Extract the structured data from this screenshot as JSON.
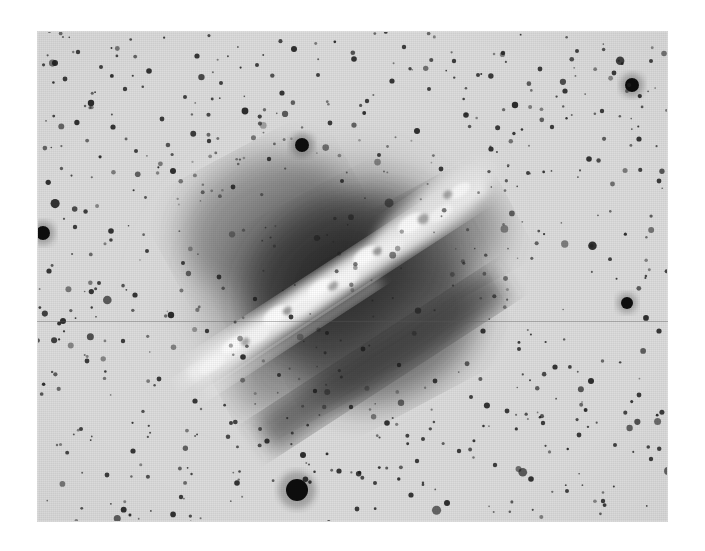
{
  "figure": {
    "kind": "astronomical-photographic-plate",
    "polarity": "negative",
    "caption": ""
  },
  "plate": {
    "left": 37,
    "top": 31,
    "width": 631,
    "height": 491,
    "sky_background_color": "#dcdcdc",
    "page_background_color": "#ffffff",
    "grain_opacity": 0.3
  },
  "galaxy": {
    "center_x": 325,
    "center_y": 268,
    "semi_major": 178,
    "semi_minor": 132,
    "position_angle_deg": -28,
    "halo_color_outer": "#c9c9c9",
    "halo_color_mid": "#8f8f8f",
    "halo_color_core": "#3a3a3a",
    "core_color_darkest": "#262626"
  },
  "dust_lane": {
    "description": "bright band in negative running lower-left to upper-right",
    "start_x": 175,
    "start_y": 395,
    "end_x": 470,
    "end_y": 200,
    "angle_deg": -33,
    "thickness": 34,
    "color_bright": "#f2f2f2",
    "color_mid": "#d0d0d0"
  },
  "artifacts": {
    "scratch_lines": [
      {
        "y": 290,
        "opacity": 0.38
      }
    ]
  },
  "stars": {
    "count_label": "dense foreground star field",
    "color": "#1c1c1c",
    "bright_star_color": "#0d0d0d",
    "notable": [
      {
        "name": "bright-star-bottom-center",
        "x": 260,
        "y": 459,
        "r": 11
      },
      {
        "name": "bright-star-left-edge",
        "x": 6,
        "y": 202,
        "r": 7
      },
      {
        "name": "bright-star-upper-right",
        "x": 595,
        "y": 54,
        "r": 7
      },
      {
        "name": "bright-star-right-mid",
        "x": 590,
        "y": 272,
        "r": 6
      },
      {
        "name": "bright-star-upper-mid",
        "x": 265,
        "y": 114,
        "r": 7
      }
    ]
  },
  "chart_data": {
    "type": "scatter",
    "title": "",
    "xlabel": "",
    "ylabel": "",
    "note": "Star positions on the plate (plate-local pixel coordinates, origin top-left of the plate). r = apparent radius in pixels; larger r = brighter star on the negative.",
    "points": [
      {
        "x": 6,
        "y": 202,
        "r": 7
      },
      {
        "x": 18,
        "y": 32,
        "r": 3
      },
      {
        "x": 28,
        "y": 48,
        "r": 2.4
      },
      {
        "x": 41,
        "y": 21,
        "r": 2.2
      },
      {
        "x": 54,
        "y": 72,
        "r": 3.2
      },
      {
        "x": 64,
        "y": 36,
        "r": 2
      },
      {
        "x": 76,
        "y": 96,
        "r": 2.6
      },
      {
        "x": 88,
        "y": 58,
        "r": 2.2
      },
      {
        "x": 99,
        "y": 120,
        "r": 2
      },
      {
        "x": 112,
        "y": 40,
        "r": 2.8
      },
      {
        "x": 125,
        "y": 88,
        "r": 2.4
      },
      {
        "x": 136,
        "y": 140,
        "r": 3
      },
      {
        "x": 148,
        "y": 66,
        "r": 2
      },
      {
        "x": 160,
        "y": 25,
        "r": 2.6
      },
      {
        "x": 172,
        "y": 110,
        "r": 2.2
      },
      {
        "x": 184,
        "y": 52,
        "r": 2
      },
      {
        "x": 196,
        "y": 156,
        "r": 2.4
      },
      {
        "x": 208,
        "y": 80,
        "r": 3.4
      },
      {
        "x": 220,
        "y": 34,
        "r": 2
      },
      {
        "x": 232,
        "y": 128,
        "r": 2.2
      },
      {
        "x": 245,
        "y": 62,
        "r": 2.6
      },
      {
        "x": 257,
        "y": 18,
        "r": 3
      },
      {
        "x": 265,
        "y": 114,
        "r": 7
      },
      {
        "x": 281,
        "y": 44,
        "r": 2
      },
      {
        "x": 293,
        "y": 92,
        "r": 2.4
      },
      {
        "x": 305,
        "y": 150,
        "r": 2
      },
      {
        "x": 317,
        "y": 28,
        "r": 2.8
      },
      {
        "x": 330,
        "y": 70,
        "r": 2.2
      },
      {
        "x": 342,
        "y": 124,
        "r": 2
      },
      {
        "x": 355,
        "y": 50,
        "r": 2.6
      },
      {
        "x": 367,
        "y": 16,
        "r": 2.2
      },
      {
        "x": 380,
        "y": 100,
        "r": 3
      },
      {
        "x": 392,
        "y": 58,
        "r": 2
      },
      {
        "x": 404,
        "y": 138,
        "r": 2.4
      },
      {
        "x": 417,
        "y": 30,
        "r": 2.2
      },
      {
        "x": 429,
        "y": 84,
        "r": 2.8
      },
      {
        "x": 441,
        "y": 44,
        "r": 2
      },
      {
        "x": 454,
        "y": 118,
        "r": 2.6
      },
      {
        "x": 466,
        "y": 22,
        "r": 2.2
      },
      {
        "x": 478,
        "y": 74,
        "r": 3.2
      },
      {
        "x": 491,
        "y": 142,
        "r": 2
      },
      {
        "x": 503,
        "y": 38,
        "r": 2.4
      },
      {
        "x": 515,
        "y": 96,
        "r": 2.2
      },
      {
        "x": 528,
        "y": 60,
        "r": 2.6
      },
      {
        "x": 540,
        "y": 20,
        "r": 2
      },
      {
        "x": 552,
        "y": 128,
        "r": 2.8
      },
      {
        "x": 565,
        "y": 80,
        "r": 2.2
      },
      {
        "x": 577,
        "y": 42,
        "r": 2.4
      },
      {
        "x": 595,
        "y": 54,
        "r": 7
      },
      {
        "x": 602,
        "y": 108,
        "r": 2.6
      },
      {
        "x": 614,
        "y": 30,
        "r": 2
      },
      {
        "x": 622,
        "y": 150,
        "r": 2.4
      },
      {
        "x": 12,
        "y": 240,
        "r": 2.6
      },
      {
        "x": 26,
        "y": 290,
        "r": 3
      },
      {
        "x": 38,
        "y": 196,
        "r": 2.2
      },
      {
        "x": 50,
        "y": 330,
        "r": 2.4
      },
      {
        "x": 62,
        "y": 252,
        "r": 2
      },
      {
        "x": 74,
        "y": 200,
        "r": 2.8
      },
      {
        "x": 86,
        "y": 310,
        "r": 2.2
      },
      {
        "x": 98,
        "y": 264,
        "r": 2.6
      },
      {
        "x": 110,
        "y": 220,
        "r": 2
      },
      {
        "x": 122,
        "y": 348,
        "r": 2.4
      },
      {
        "x": 134,
        "y": 284,
        "r": 3.2
      },
      {
        "x": 146,
        "y": 232,
        "r": 2
      },
      {
        "x": 158,
        "y": 370,
        "r": 2.6
      },
      {
        "x": 170,
        "y": 300,
        "r": 2.2
      },
      {
        "x": 182,
        "y": 246,
        "r": 2.4
      },
      {
        "x": 194,
        "y": 392,
        "r": 2
      },
      {
        "x": 206,
        "y": 326,
        "r": 2.8
      },
      {
        "x": 218,
        "y": 268,
        "r": 2.2
      },
      {
        "x": 230,
        "y": 410,
        "r": 2.6
      },
      {
        "x": 242,
        "y": 344,
        "r": 2
      },
      {
        "x": 254,
        "y": 286,
        "r": 2.4
      },
      {
        "x": 266,
        "y": 424,
        "r": 3
      },
      {
        "x": 278,
        "y": 360,
        "r": 2.2
      },
      {
        "x": 290,
        "y": 302,
        "r": 2
      },
      {
        "x": 302,
        "y": 440,
        "r": 2.6
      },
      {
        "x": 314,
        "y": 376,
        "r": 2.2
      },
      {
        "x": 326,
        "y": 318,
        "r": 2.4
      },
      {
        "x": 338,
        "y": 452,
        "r": 2
      },
      {
        "x": 350,
        "y": 392,
        "r": 2.8
      },
      {
        "x": 362,
        "y": 334,
        "r": 2.2
      },
      {
        "x": 374,
        "y": 464,
        "r": 2.6
      },
      {
        "x": 386,
        "y": 408,
        "r": 2
      },
      {
        "x": 398,
        "y": 350,
        "r": 2.4
      },
      {
        "x": 410,
        "y": 472,
        "r": 3
      },
      {
        "x": 422,
        "y": 420,
        "r": 2.2
      },
      {
        "x": 434,
        "y": 366,
        "r": 2
      },
      {
        "x": 446,
        "y": 300,
        "r": 2.6
      },
      {
        "x": 458,
        "y": 434,
        "r": 2.2
      },
      {
        "x": 470,
        "y": 380,
        "r": 2.4
      },
      {
        "x": 482,
        "y": 318,
        "r": 2
      },
      {
        "x": 494,
        "y": 448,
        "r": 2.8
      },
      {
        "x": 506,
        "y": 392,
        "r": 2.2
      },
      {
        "x": 518,
        "y": 336,
        "r": 2.6
      },
      {
        "x": 530,
        "y": 460,
        "r": 2
      },
      {
        "x": 542,
        "y": 404,
        "r": 2.4
      },
      {
        "x": 554,
        "y": 350,
        "r": 3
      },
      {
        "x": 566,
        "y": 470,
        "r": 2.2
      },
      {
        "x": 578,
        "y": 414,
        "r": 2
      },
      {
        "x": 590,
        "y": 272,
        "r": 6
      },
      {
        "x": 602,
        "y": 364,
        "r": 2.4
      },
      {
        "x": 614,
        "y": 428,
        "r": 2.2
      },
      {
        "x": 622,
        "y": 300,
        "r": 2.6
      },
      {
        "x": 260,
        "y": 459,
        "r": 11
      },
      {
        "x": 200,
        "y": 452,
        "r": 2.8
      },
      {
        "x": 320,
        "y": 478,
        "r": 2.4
      },
      {
        "x": 144,
        "y": 466,
        "r": 2.2
      },
      {
        "x": 96,
        "y": 420,
        "r": 2.6
      },
      {
        "x": 44,
        "y": 398,
        "r": 2
      },
      {
        "x": 70,
        "y": 444,
        "r": 2.4
      },
      {
        "x": 380,
        "y": 430,
        "r": 2.2
      }
    ]
  }
}
